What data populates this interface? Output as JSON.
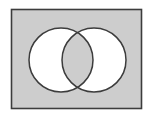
{
  "figure": {
    "name": "venn-symmetric-difference",
    "canvas": {
      "width": 157,
      "height": 120,
      "background_color": "#ffffff"
    },
    "universe_rect": {
      "label": "",
      "x": 11.5,
      "y": 9.5,
      "width": 130,
      "height": 99,
      "fill_color": "#cdcdcd",
      "stroke_color": "#3c3c3c",
      "stroke_width": 1.6
    },
    "circles": [
      {
        "label": "",
        "name": "left-set-circle",
        "cx": 61,
        "cy": 60,
        "r": 32,
        "stroke_color": "#3c3c3c",
        "stroke_width": 1.5
      },
      {
        "label": "",
        "name": "right-set-circle",
        "cx": 94,
        "cy": 60,
        "r": 32,
        "stroke_color": "#3c3c3c",
        "stroke_width": 1.5
      }
    ],
    "regions": [
      {
        "name": "left-only-region",
        "description": "left circle minus right circle",
        "fill_color": "#ffffff",
        "shaded": false
      },
      {
        "name": "right-only-region",
        "description": "right circle minus left circle",
        "fill_color": "#ffffff",
        "shaded": false
      },
      {
        "name": "intersection-region",
        "description": "overlap of both circles",
        "fill_color": "#cdcdcd",
        "shaded": true
      },
      {
        "name": "outside-region",
        "description": "rectangle outside both circles",
        "fill_color": "#cdcdcd",
        "shaded": true
      }
    ]
  }
}
